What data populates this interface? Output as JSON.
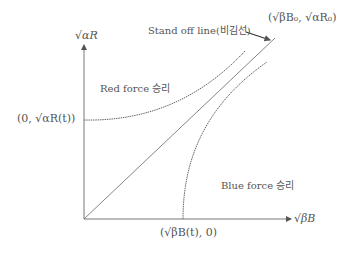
{
  "diagram": {
    "type": "phase-plane",
    "axes": {
      "y_label": "√αR",
      "x_label": "√βB"
    },
    "points": {
      "y_intercept_label": "(0, √αR(t))",
      "x_intercept_label": "(√βB(t), 0)",
      "end_point_label": "(√βB₀, √αR₀)"
    },
    "regions": {
      "red_label": "Red force 승리",
      "blue_label": "Blue force 승리"
    },
    "lines": {
      "standoff_label": "Stand off line(비김선)"
    },
    "colors": {
      "line": "#666666",
      "text": "#555555",
      "background": "#ffffff"
    }
  }
}
